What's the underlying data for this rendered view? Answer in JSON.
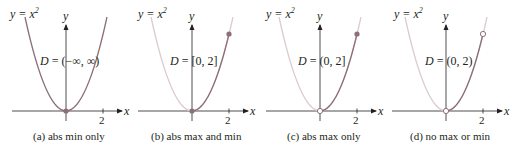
{
  "figure": {
    "equation_label": "y = x",
    "equation_exponent": "2",
    "y_axis_label": "y",
    "x_axis_label": "x",
    "tick_label": "2",
    "colors": {
      "highlighted_curve": "#8b6f79",
      "faded_curve": "#dccbd0",
      "axis": "#231f20",
      "point": "#8b6f79"
    }
  },
  "panels": [
    {
      "id": "a",
      "domain_prefix": "D",
      "domain_text": "= (−∞, ∞)",
      "caption": "(a) abs min only",
      "origin_point": "filled",
      "end_point": "none",
      "curve_range": "all"
    },
    {
      "id": "b",
      "domain_prefix": "D",
      "domain_text": "= [0, 2]",
      "caption": "(b) abs max and min",
      "origin_point": "filled",
      "end_point": "filled",
      "curve_range": "0-2"
    },
    {
      "id": "c",
      "domain_prefix": "D",
      "domain_text": "= (0, 2]",
      "caption": "(c) abs max only",
      "origin_point": "open",
      "end_point": "filled",
      "curve_range": "0-2"
    },
    {
      "id": "d",
      "domain_prefix": "D",
      "domain_text": "= (0, 2)",
      "caption": "(d) no max or min",
      "origin_point": "open",
      "end_point": "open",
      "curve_range": "0-2"
    }
  ]
}
